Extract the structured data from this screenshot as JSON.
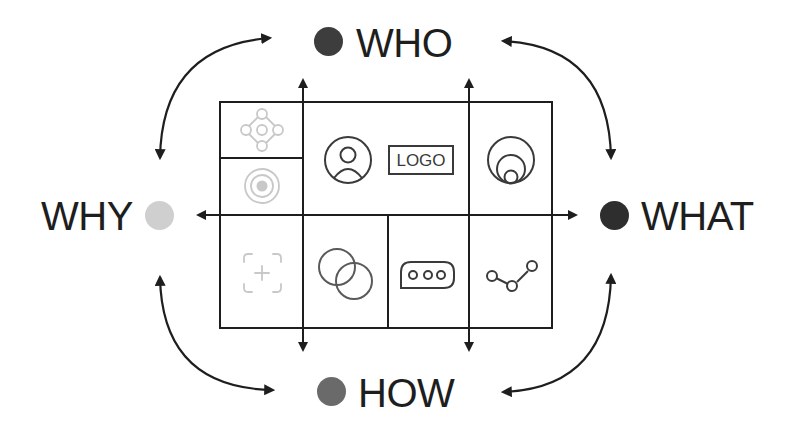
{
  "labels": {
    "who": {
      "text": "WHO",
      "dot_color": "#3d3d3d"
    },
    "what": {
      "text": "WHAT",
      "dot_color": "#2e2e2e"
    },
    "why": {
      "text": "WHY",
      "dot_color": "#cfcfcf"
    },
    "how": {
      "text": "HOW",
      "dot_color": "#6a6a6a"
    }
  },
  "grid": {
    "cells": [
      {
        "id": "top-left-upper",
        "icon": "network-nodes-icon"
      },
      {
        "id": "top-left-lower",
        "icon": "target-icon"
      },
      {
        "id": "top-middle",
        "icons": [
          "user-avatar-icon",
          "logo-box"
        ],
        "logo_text": "LOGO"
      },
      {
        "id": "top-right",
        "icon": "nested-circles-icon"
      },
      {
        "id": "bottom-1",
        "icon": "add-frame-icon"
      },
      {
        "id": "bottom-2",
        "icon": "overlapping-circles-icon"
      },
      {
        "id": "bottom-3",
        "icon": "chat-bubble-icon"
      },
      {
        "id": "bottom-4",
        "icon": "line-graph-icon"
      }
    ]
  },
  "colors": {
    "line": "#1e1e1e",
    "icon_dark": "#3a3a3a",
    "icon_mid": "#5a5a5a",
    "icon_light": "#c8c8c8"
  }
}
